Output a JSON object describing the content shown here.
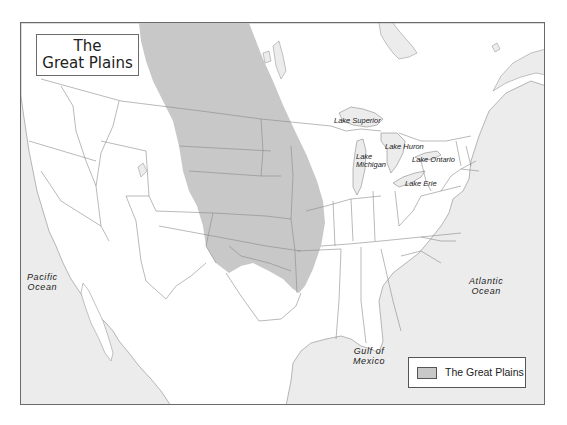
{
  "title": {
    "line1": "The",
    "line2": "Great Plains"
  },
  "lakes": [
    {
      "name": "Lake Superior"
    },
    {
      "name": "Lake Huron"
    },
    {
      "name": "Lake Michigan",
      "line1": "Lake",
      "line2": "Michigan"
    },
    {
      "name": "Lake Ontario"
    },
    {
      "name": "Lake Erie"
    }
  ],
  "oceans": {
    "pacific": {
      "line1": "Pacific",
      "line2": "Ocean"
    },
    "atlantic": {
      "line1": "Atlantic",
      "line2": "Ocean"
    },
    "gulf": {
      "line1": "Gulf of",
      "line2": "Mexico"
    }
  },
  "legend": {
    "items": [
      {
        "label": "The Great Plains",
        "color": "#c8c8c8"
      }
    ]
  },
  "colors": {
    "water": "#ececec",
    "land": "#ffffff",
    "plains": "#c8c8c8",
    "border": "#8a8a8a"
  }
}
